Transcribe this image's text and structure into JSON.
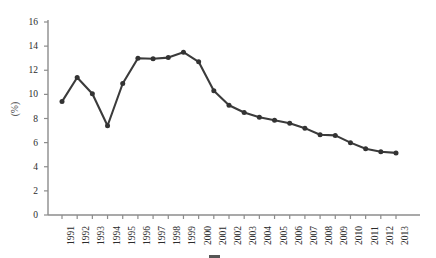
{
  "chart_data": {
    "type": "line",
    "title": "",
    "xlabel": "",
    "ylabel": "(%)",
    "ylim": [
      0,
      16
    ],
    "ytick_step": 2,
    "yticks": [
      "0",
      "2",
      "4",
      "6",
      "8",
      "10",
      "12",
      "14",
      "16"
    ],
    "grid": false,
    "legend_position": "below",
    "marker": "filled-circle",
    "line_color": "#3b3b3b",
    "marker_color": "#333333",
    "axis_color": "#8c8c8c",
    "categories": [
      "1991",
      "1992",
      "1993",
      "1994",
      "1995",
      "1996",
      "1997",
      "1998",
      "1999",
      "2000",
      "2001",
      "2002",
      "2003",
      "2004",
      "2005",
      "2006",
      "2007",
      "2008",
      "2009",
      "2010",
      "2011",
      "2012",
      "2013"
    ],
    "values": [
      9.4,
      11.4,
      10.05,
      7.4,
      10.9,
      13.0,
      12.95,
      13.05,
      13.5,
      12.7,
      10.3,
      9.1,
      8.5,
      8.1,
      7.85,
      7.6,
      7.2,
      6.65,
      6.6,
      6.0,
      5.5,
      5.25,
      5.15
    ],
    "series": [
      {
        "name": "",
        "values": [
          9.4,
          11.4,
          10.05,
          7.4,
          10.9,
          13.0,
          12.95,
          13.05,
          13.5,
          12.7,
          10.3,
          9.1,
          8.5,
          8.1,
          7.85,
          7.6,
          7.2,
          6.65,
          6.6,
          6.0,
          5.5,
          5.25,
          5.15
        ]
      }
    ]
  },
  "caption": {
    "text": ""
  }
}
